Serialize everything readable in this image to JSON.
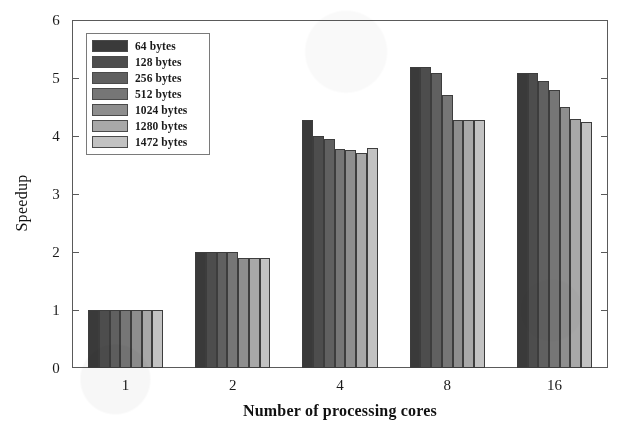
{
  "chart_data": {
    "type": "bar",
    "title": "",
    "xlabel": "Number of processing cores",
    "ylabel": "Speedup",
    "categories": [
      "1",
      "2",
      "4",
      "8",
      "16"
    ],
    "ylim": [
      0,
      6
    ],
    "yticks": [
      0,
      1,
      2,
      3,
      4,
      5,
      6
    ],
    "grid": false,
    "legend_position": "upper-left",
    "series": [
      {
        "name": "64 bytes",
        "color": "#3a3a3a",
        "values": [
          1.0,
          2.0,
          4.28,
          5.19,
          5.08
        ]
      },
      {
        "name": "128 bytes",
        "color": "#4d4d4d",
        "values": [
          1.0,
          2.0,
          4.0,
          5.19,
          5.08
        ]
      },
      {
        "name": "256 bytes",
        "color": "#606060",
        "values": [
          1.0,
          2.0,
          3.95,
          5.08,
          4.95
        ]
      },
      {
        "name": "512 bytes",
        "color": "#767676",
        "values": [
          1.0,
          2.0,
          3.78,
          4.7,
          4.8
        ]
      },
      {
        "name": "1024 bytes",
        "color": "#8e8e8e",
        "values": [
          1.0,
          1.9,
          3.76,
          4.28,
          4.5
        ]
      },
      {
        "name": "1280 bytes",
        "color": "#a8a8a8",
        "values": [
          1.0,
          1.9,
          3.7,
          4.28,
          4.3
        ]
      },
      {
        "name": "1472 bytes",
        "color": "#c2c2c2",
        "values": [
          1.0,
          1.9,
          3.8,
          4.28,
          4.25
        ]
      }
    ]
  },
  "legend": {
    "items": [
      {
        "label": "64 bytes",
        "color": "#3a3a3a"
      },
      {
        "label": "128 bytes",
        "color": "#4d4d4d"
      },
      {
        "label": "256 bytes",
        "color": "#606060"
      },
      {
        "label": "512 bytes",
        "color": "#767676"
      },
      {
        "label": "1024 bytes",
        "color": "#8e8e8e"
      },
      {
        "label": "1280 bytes",
        "color": "#a8a8a8"
      },
      {
        "label": "1472 bytes",
        "color": "#c2c2c2"
      }
    ]
  },
  "axes": {
    "y_title": "Speedup",
    "x_title": "Number of processing cores",
    "y_tick_labels": [
      "0",
      "1",
      "2",
      "3",
      "4",
      "5",
      "6"
    ],
    "x_tick_labels": [
      "1",
      "2",
      "4",
      "8",
      "16"
    ]
  },
  "colors": {
    "axis": "#5a5a5a",
    "bar_outline": "#3d3d3d",
    "background": "#ffffff",
    "text": "#111111"
  }
}
